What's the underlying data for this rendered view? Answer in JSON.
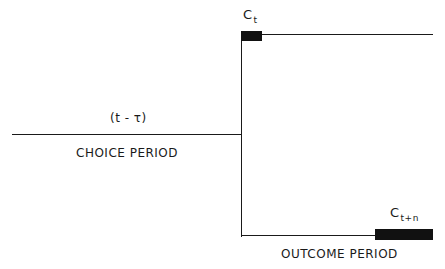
{
  "diagram": {
    "choice_time_label": "(t - τ)",
    "choice_period_label": "CHOICE PERIOD",
    "outcome_period_label": "OUTCOME PERIOD",
    "ct_label": {
      "main": "C",
      "sub": "t"
    },
    "ctn_label": {
      "main": "C",
      "sub": "t+n"
    }
  }
}
